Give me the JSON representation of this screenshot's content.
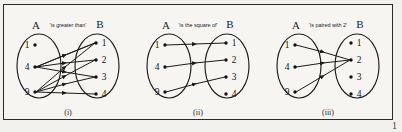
{
  "figure": {
    "background_color": "#f2f1ee",
    "border_color": "#2b2b2b",
    "page_number": "1"
  },
  "sets": {
    "left_label": "A",
    "right_label": "B",
    "domain_elements": [
      "1",
      "4",
      "9"
    ],
    "codomain_elements": [
      "1",
      "2",
      "3",
      "4"
    ]
  },
  "panels": [
    {
      "id": "panel-i",
      "caption": "(i)",
      "relation_label": "'is greater than'",
      "set_a_label": "A",
      "set_b_label": "B",
      "a_elements": [
        "1",
        "4",
        "9"
      ],
      "b_elements": [
        "1",
        "2",
        "3",
        "4"
      ],
      "mappings": [
        {
          "from": "4",
          "to": "1"
        },
        {
          "from": "4",
          "to": "2"
        },
        {
          "from": "4",
          "to": "3"
        },
        {
          "from": "9",
          "to": "1"
        },
        {
          "from": "9",
          "to": "2"
        },
        {
          "from": "9",
          "to": "3"
        },
        {
          "from": "9",
          "to": "4"
        }
      ]
    },
    {
      "id": "panel-ii",
      "caption": "(ii)",
      "relation_label": "'is the square of'",
      "set_a_label": "A",
      "set_b_label": "B",
      "a_elements": [
        "1",
        "4",
        "9"
      ],
      "b_elements": [
        "1",
        "2",
        "3",
        "4"
      ],
      "mappings": [
        {
          "from": "1",
          "to": "1"
        },
        {
          "from": "4",
          "to": "2"
        },
        {
          "from": "9",
          "to": "3"
        }
      ]
    },
    {
      "id": "panel-iii",
      "caption": "(iii)",
      "relation_label": "'is paired with 2'",
      "set_a_label": "A",
      "set_b_label": "B",
      "a_elements": [
        "1",
        "4",
        "9"
      ],
      "b_elements": [
        "1",
        "2",
        "3",
        "4"
      ],
      "mappings": [
        {
          "from": "1",
          "to": "2"
        },
        {
          "from": "4",
          "to": "2"
        },
        {
          "from": "9",
          "to": "2"
        }
      ]
    }
  ]
}
